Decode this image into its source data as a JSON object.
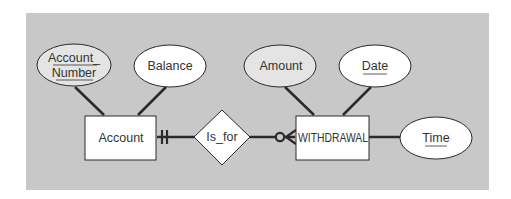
{
  "diagram": {
    "type": "Entity-Relationship Diagram",
    "colors": {
      "background": "#c8c8c8",
      "line": "#2a2a2a",
      "entity_fill": "#ffffff",
      "attribute_fill": "#ffffff",
      "attribute_key_fill_shaded": "#e4e4e4",
      "text": "#333333"
    },
    "entities": [
      {
        "id": "account",
        "label": "Account"
      },
      {
        "id": "withdrawal",
        "label": "WITHDRAWAL"
      }
    ],
    "relationship": {
      "id": "is_for",
      "label": "Is_for"
    },
    "attributes": [
      {
        "id": "account_number",
        "line1": "Account_",
        "line2": "Number",
        "owner": "Account",
        "underlined": true,
        "shaded": true
      },
      {
        "id": "balance",
        "label": "Balance",
        "owner": "Account",
        "underlined": false,
        "shaded": false
      },
      {
        "id": "amount",
        "label": "Amount",
        "owner": "WITHDRAWAL",
        "underlined": false,
        "shaded": true
      },
      {
        "id": "date",
        "label": "Date",
        "owner": "WITHDRAWAL",
        "underlined": true,
        "shaded": false
      },
      {
        "id": "time",
        "label": "Time",
        "owner": "WITHDRAWAL",
        "underlined": true,
        "shaded": false
      }
    ],
    "cardinality": {
      "account_side": "mandatory-one",
      "withdrawal_side": "optional-many"
    }
  }
}
